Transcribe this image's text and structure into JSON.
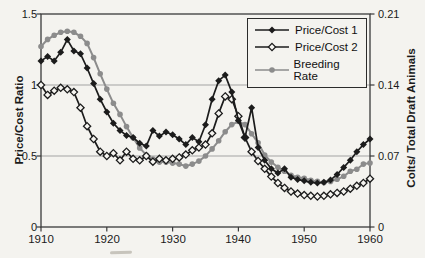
{
  "figure": {
    "background": "#f4f3ef",
    "axis_color": "#3a3a3a",
    "gridline_color": "#a3a3a3"
  },
  "chart_data": {
    "type": "line",
    "title": "",
    "legend_position": "top-right",
    "grid": "horizontal gridlines at left 0.5 and 1.0 (right 0.07 and 0.14)",
    "x_axis": {
      "min": 1910,
      "max": 1960,
      "ticks": [
        "1910",
        "1920",
        "1930",
        "1940",
        "1950",
        "1960"
      ],
      "tick_values": [
        1910,
        1920,
        1930,
        1940,
        1950,
        1960
      ]
    },
    "left_axis": {
      "label": "Price/Cost Ratio",
      "min": 0,
      "max": 1.5,
      "ticks": [
        "1.5",
        "1",
        "0.5",
        "0"
      ],
      "tick_values": [
        1.5,
        1,
        0.5,
        0
      ]
    },
    "right_axis": {
      "label": "Colts/ Total Draft Animals",
      "min": 0,
      "max": 0.21,
      "ticks": [
        "0.21",
        "0.14",
        "0.07",
        "0"
      ],
      "tick_values": [
        0.21,
        0.14,
        0.07,
        0
      ]
    },
    "gridlines_left_values": [
      0.5,
      1.0
    ],
    "x": [
      1910,
      1911,
      1912,
      1913,
      1914,
      1915,
      1916,
      1917,
      1918,
      1919,
      1920,
      1921,
      1922,
      1923,
      1924,
      1925,
      1926,
      1927,
      1928,
      1929,
      1930,
      1931,
      1932,
      1933,
      1934,
      1935,
      1936,
      1937,
      1938,
      1939,
      1940,
      1941,
      1942,
      1943,
      1944,
      1945,
      1946,
      1947,
      1948,
      1949,
      1950,
      1951,
      1952,
      1953,
      1954,
      1955,
      1956,
      1957,
      1958,
      1959,
      1960
    ],
    "series": [
      {
        "name": "Price/Cost 1",
        "axis": "left",
        "marker": "filled-diamond",
        "color": "#1c1c1c",
        "values": [
          1.17,
          1.2,
          1.17,
          1.23,
          1.32,
          1.24,
          1.22,
          1.12,
          1.01,
          0.9,
          0.81,
          0.73,
          0.68,
          0.645,
          0.63,
          0.59,
          0.57,
          0.68,
          0.64,
          0.67,
          0.65,
          0.62,
          0.58,
          0.63,
          0.6,
          0.72,
          0.9,
          1.03,
          1.07,
          0.95,
          0.75,
          0.63,
          0.84,
          0.56,
          0.47,
          0.41,
          0.38,
          0.41,
          0.35,
          0.335,
          0.325,
          0.315,
          0.31,
          0.315,
          0.33,
          0.37,
          0.42,
          0.47,
          0.53,
          0.58,
          0.62
        ]
      },
      {
        "name": "Price/Cost 2",
        "axis": "left",
        "marker": "open-diamond",
        "color": "#1c1c1c",
        "marker_fill": "#f6f5f1",
        "values": [
          1.0,
          0.93,
          0.96,
          0.98,
          0.97,
          0.95,
          0.84,
          0.71,
          0.62,
          0.53,
          0.5,
          0.52,
          0.47,
          0.53,
          0.48,
          0.47,
          0.5,
          0.46,
          0.48,
          0.47,
          0.48,
          0.49,
          0.51,
          0.54,
          0.56,
          0.58,
          0.66,
          0.8,
          0.92,
          0.9,
          0.78,
          0.63,
          0.53,
          0.465,
          0.41,
          0.355,
          0.31,
          0.275,
          0.25,
          0.235,
          0.225,
          0.22,
          0.215,
          0.22,
          0.23,
          0.24,
          0.25,
          0.27,
          0.29,
          0.31,
          0.34
        ]
      },
      {
        "name": "Breeding Rate",
        "axis": "right",
        "marker": "filled-circle",
        "color": "#8c8c8c",
        "values": [
          0.178,
          0.185,
          0.189,
          0.192,
          0.193,
          0.192,
          0.188,
          0.181,
          0.167,
          0.151,
          0.136,
          0.122,
          0.111,
          0.099,
          0.088,
          0.078,
          0.071,
          0.067,
          0.064,
          0.064,
          0.063,
          0.062,
          0.06,
          0.062,
          0.065,
          0.07,
          0.077,
          0.085,
          0.094,
          0.101,
          0.104,
          0.101,
          0.092,
          0.083,
          0.071,
          0.064,
          0.059,
          0.055,
          0.051,
          0.049,
          0.048,
          0.046,
          0.045,
          0.044,
          0.045,
          0.047,
          0.05,
          0.055,
          0.057,
          0.062,
          0.063
        ]
      }
    ]
  },
  "legend": {
    "items": [
      "Price/Cost 1",
      "Price/Cost 2",
      "Breeding Rate"
    ]
  }
}
